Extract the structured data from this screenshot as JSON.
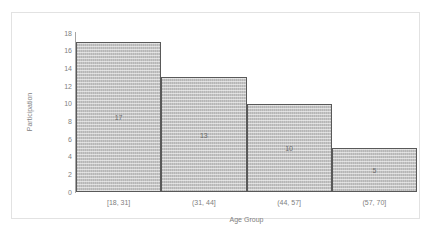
{
  "chart_data": {
    "type": "bar",
    "title": "",
    "subtitle": "",
    "xlabel": "Age Group",
    "ylabel": "Participation",
    "categories": [
      "[18, 31]",
      "(31, 44]",
      "(44, 57]",
      "(57, 70]"
    ],
    "values": [
      17,
      13,
      10,
      5
    ],
    "data_labels": [
      "17",
      "13",
      "10",
      "5"
    ],
    "ylim": [
      0,
      18
    ],
    "yticks": [
      0,
      2,
      4,
      6,
      8,
      10,
      12,
      14,
      16,
      18
    ],
    "ytick_labels": [
      "0",
      "2",
      "4",
      "6",
      "8",
      "10",
      "12",
      "14",
      "16",
      "18"
    ],
    "grid": false,
    "legend": null,
    "legend_position": "none",
    "bar_gap": 0,
    "style": {
      "bar_fill": "#c0c0c0",
      "bar_border": "#595959",
      "axis_color": "#a6a6a6",
      "text_color": "#808080",
      "frame_color": "#e2e2e2",
      "background": "#ffffff"
    }
  }
}
